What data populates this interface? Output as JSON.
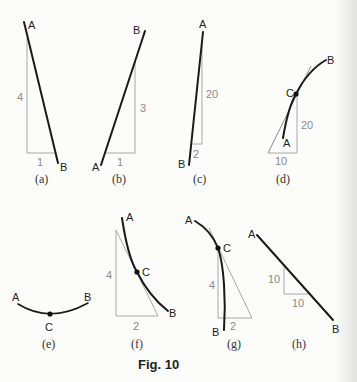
{
  "figure": {
    "caption": "Fig. 10",
    "panels": [
      {
        "id": "a",
        "caption": "(a)",
        "start_label": "A",
        "end_label": "B",
        "rise": "4",
        "run": "1",
        "shape": "straight line"
      },
      {
        "id": "b",
        "caption": "(b)",
        "start_label": "A",
        "end_label": "B",
        "rise": "3",
        "run": "1",
        "shape": "straight line"
      },
      {
        "id": "c",
        "caption": "(c)",
        "start_label": "A",
        "end_label": "B",
        "rise": "20",
        "run": "2",
        "shape": "straight line"
      },
      {
        "id": "d",
        "caption": "(d)",
        "start_label": "A",
        "end_label": "B",
        "point_label": "C",
        "rise": "20",
        "run": "10",
        "shape": "curve with tangent"
      },
      {
        "id": "e",
        "caption": "(e)",
        "start_label": "A",
        "end_label": "B",
        "point_label": "C",
        "shape": "arc"
      },
      {
        "id": "f",
        "caption": "(f)",
        "start_label": "A",
        "end_label": "B",
        "point_label": "C",
        "rise": "4",
        "run": "2",
        "shape": "curve with tangent"
      },
      {
        "id": "g",
        "caption": "(g)",
        "start_label": "A",
        "end_label": "B",
        "point_label": "C",
        "rise": "4",
        "run": "2",
        "shape": "curve with tangent"
      },
      {
        "id": "h",
        "caption": "(h)",
        "start_label": "A",
        "end_label": "B",
        "rise": "10",
        "run": "10",
        "shape": "straight line"
      }
    ]
  },
  "colors": {
    "line": "#1a1a1a",
    "triangle": "#a8a8a8",
    "dimension_text": "#8a8a8a",
    "background": "#fcfcfb"
  }
}
